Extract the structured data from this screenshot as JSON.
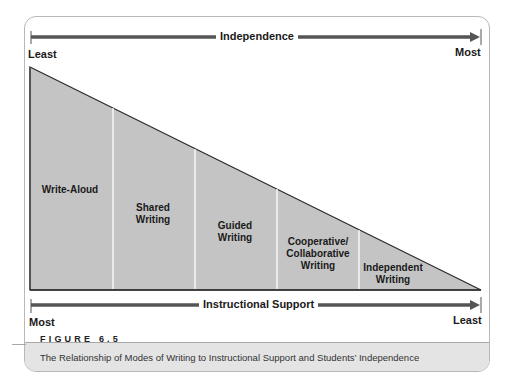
{
  "figure": {
    "number_label": "FIGURE 6.5",
    "caption": "The Relationship of Modes of Writing to Instructional Support and Students’ Independence"
  },
  "top_axis": {
    "title": "Independence",
    "left_label": "Least",
    "right_label": "Most",
    "direction": "left-to-right arrow"
  },
  "bottom_axis": {
    "title": "Instructional Support",
    "left_label": "Most",
    "right_label": "Least",
    "direction": "left-to-right arrow"
  },
  "segments": [
    {
      "line1": "Write-Aloud",
      "line2": "",
      "line3": ""
    },
    {
      "line1": "Shared",
      "line2": "Writing",
      "line3": ""
    },
    {
      "line1": "Guided",
      "line2": "Writing",
      "line3": ""
    },
    {
      "line1": "Cooperative/",
      "line2": "Collaborative",
      "line3": "Writing"
    },
    {
      "line1": "Independent",
      "line2": "Writing",
      "line3": ""
    }
  ],
  "colors": {
    "triangle_fill": "#c4c4c4",
    "arrow": "#555555",
    "outline": "#2a2a2a",
    "caption_band": "#e4e4e4"
  }
}
